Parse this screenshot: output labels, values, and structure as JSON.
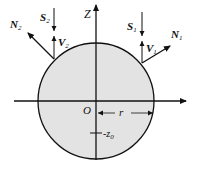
{
  "diagram": {
    "colors": {
      "circle_fill": "#e3e3e3",
      "stroke": "#111111",
      "background": "#ffffff"
    },
    "axes": {
      "vertical_label": "Z",
      "origin_label": "O"
    },
    "circle": {
      "radius_label": "r",
      "depth_label": "-z",
      "depth_sub": "0"
    },
    "left_point": {
      "normal_label": "N",
      "normal_sub": "2",
      "source_label": "S",
      "source_sub": "2",
      "view_label": "V",
      "view_sub": "2"
    },
    "right_point": {
      "normal_label": "N",
      "normal_sub": "1",
      "source_label": "S",
      "source_sub": "1",
      "view_label": "V",
      "view_sub": "1"
    }
  }
}
